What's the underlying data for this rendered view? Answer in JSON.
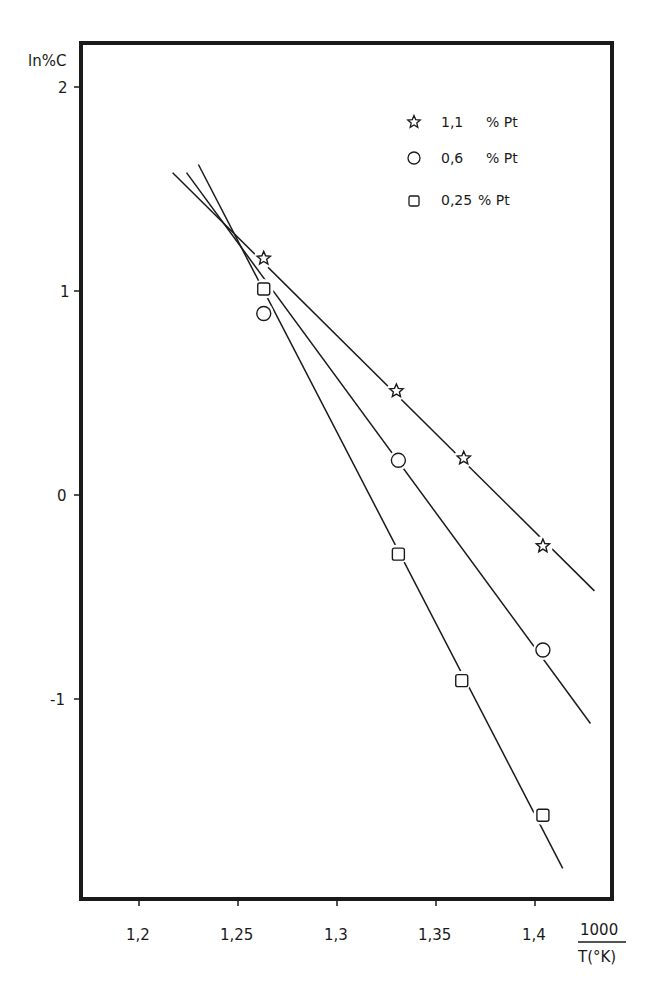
{
  "chart_data": {
    "type": "scatter",
    "title": "",
    "xlabel": "1000 / T(°K)",
    "xlabel_numerator": "1000",
    "xlabel_denominator": "T(°K)",
    "ylabel": "ln%C",
    "xlim": [
      1.17,
      1.43
    ],
    "ylim": [
      -2.0,
      2.2
    ],
    "x_ticks": [
      1.2,
      1.25,
      1.3,
      1.35,
      1.4
    ],
    "x_tick_labels": [
      "1,2",
      "1,25",
      "1,3",
      "1,35",
      "1,4"
    ],
    "y_ticks": [
      2,
      1,
      0,
      -1
    ],
    "y_tick_labels": [
      "2",
      "1",
      "0",
      "-1"
    ],
    "grid": false,
    "legend_position": "upper right",
    "series": [
      {
        "name": "1,1 % Pt",
        "marker": "star",
        "points": [
          [
            1.263,
            1.16
          ],
          [
            1.33,
            0.51
          ],
          [
            1.364,
            0.18
          ],
          [
            1.404,
            -0.25
          ]
        ],
        "fit_line": [
          [
            1.217,
            1.58
          ],
          [
            1.43,
            -0.47
          ]
        ]
      },
      {
        "name": "0,6 % Pt",
        "marker": "circle",
        "points": [
          [
            1.263,
            0.89
          ],
          [
            1.331,
            0.17
          ],
          [
            1.404,
            -0.76
          ]
        ],
        "fit_line": [
          [
            1.224,
            1.58
          ],
          [
            1.428,
            -1.12
          ]
        ]
      },
      {
        "name": "0,25 % Pt",
        "marker": "square",
        "points": [
          [
            1.263,
            1.01
          ],
          [
            1.331,
            -0.29
          ],
          [
            1.363,
            -0.91
          ],
          [
            1.404,
            -1.57
          ]
        ],
        "fit_line": [
          [
            1.23,
            1.62
          ],
          [
            1.414,
            -1.83
          ]
        ]
      }
    ]
  },
  "legend": {
    "items": [
      {
        "symbol": "star-icon",
        "value": "1,1",
        "unit": "% Pt"
      },
      {
        "symbol": "circle-icon",
        "value": "0,6",
        "unit": "% Pt"
      },
      {
        "symbol": "square-icon",
        "value": "0,25",
        "unit": "% Pt"
      }
    ]
  },
  "axes": {
    "y_title": "ln%C",
    "x_title_num": "1000",
    "x_title_den": "T(°K)"
  },
  "caption": {
    "text": "Figure 6"
  }
}
